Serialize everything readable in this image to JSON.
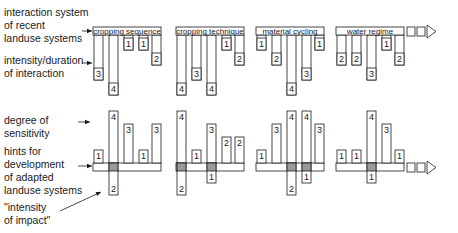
{
  "labels": {
    "interaction_system": "interaction system\nof recent\nlanduse systems",
    "intensity_duration": "intensity/duration\nof interaction",
    "degree_sensitivity": "degree of\nsensitivity",
    "hints": "hints for\ndevelopment\nof adapted\nlanduse systems",
    "intensity_impact": "\"intensity\nof impact\""
  },
  "top_groups": [
    {
      "title": "cropping sequence",
      "values": [
        3,
        4,
        1,
        1,
        2
      ]
    },
    {
      "title": "cropping technique",
      "values": [
        4,
        3,
        4,
        1,
        2
      ]
    },
    {
      "title": "material cycling",
      "values": [
        1,
        2,
        4,
        3,
        1
      ]
    },
    {
      "title": "water regime",
      "values": [
        2,
        2,
        3,
        1,
        2
      ]
    }
  ],
  "bottom_groups": [
    {
      "up": [
        1,
        4,
        3,
        1,
        3
      ],
      "down": [
        null,
        2,
        null,
        null,
        null
      ]
    },
    {
      "up": [
        4,
        1,
        3,
        2,
        2
      ],
      "down": [
        2,
        null,
        1,
        null,
        null
      ]
    },
    {
      "up": [
        1,
        3,
        4,
        4,
        3
      ],
      "down": [
        null,
        null,
        2,
        1,
        null
      ]
    },
    {
      "up": [
        1,
        1,
        4,
        3,
        1
      ],
      "down": [
        null,
        null,
        1,
        null,
        null
      ]
    }
  ],
  "colors": {
    "line": "#1a1a1a",
    "shade": "#9a9a9a"
  }
}
